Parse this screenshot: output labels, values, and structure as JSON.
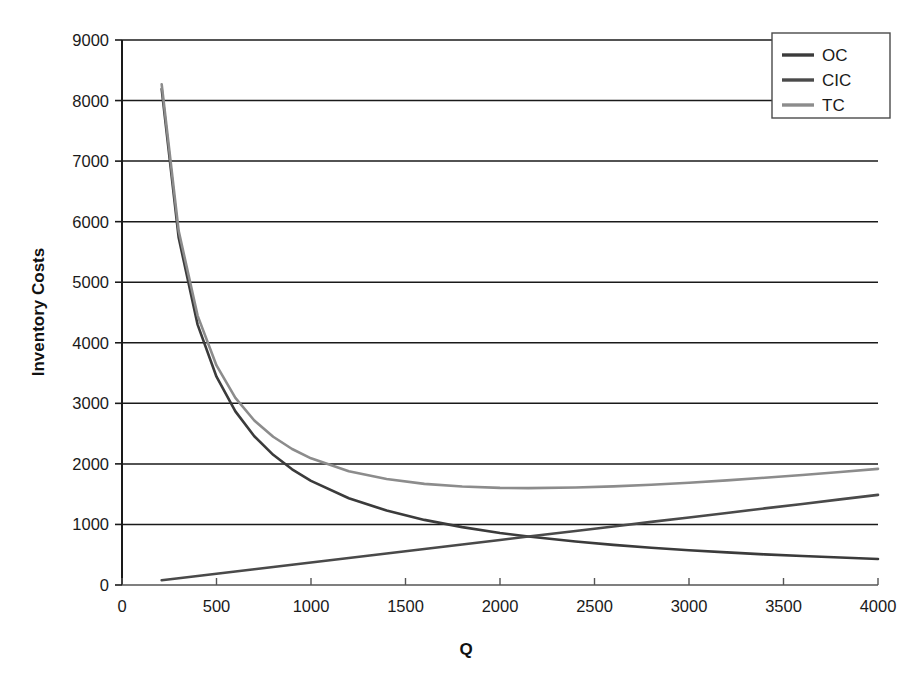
{
  "chart_data": {
    "type": "line",
    "title": "",
    "xlabel": "Q",
    "ylabel": "Inventory Costs",
    "xlim": [
      0,
      4000
    ],
    "ylim": [
      0,
      9000
    ],
    "xticks": [
      0,
      500,
      1000,
      1500,
      2000,
      2500,
      3000,
      3500,
      4000
    ],
    "yticks": [
      0,
      1000,
      2000,
      3000,
      4000,
      5000,
      6000,
      7000,
      8000,
      9000
    ],
    "xtick_labels": [
      "0",
      "500",
      "1000",
      "1500",
      "2000",
      "2500",
      "3000",
      "3500",
      "4000"
    ],
    "ytick_labels": [
      "0",
      "1000",
      "2000",
      "3000",
      "4000",
      "5000",
      "6000",
      "7000",
      "8000",
      "9000"
    ],
    "grid": "horizontal",
    "legend_position": "top-right",
    "legend_entries": [
      "OC",
      "CIC",
      "TC"
    ],
    "x": [
      210,
      300,
      400,
      500,
      600,
      700,
      800,
      900,
      1000,
      1200,
      1400,
      1600,
      1800,
      2000,
      2150,
      2400,
      2600,
      2800,
      3000,
      3200,
      3400,
      3600,
      3800,
      4000
    ],
    "series": [
      {
        "name": "OC",
        "label": "OC",
        "color": "#3b3b3b",
        "values": [
          8190,
          5733,
          4300,
          3440,
          2867,
          2457,
          2150,
          1911,
          1720,
          1433,
          1229,
          1075,
          956,
          860,
          800,
          717,
          662,
          614,
          573,
          538,
          506,
          478,
          453,
          430
        ]
      },
      {
        "name": "CIC",
        "label": "CIC",
        "color": "#4a4a4a",
        "values": [
          78,
          112,
          149,
          186,
          223,
          260,
          298,
          335,
          372,
          446,
          521,
          595,
          670,
          744,
          800,
          893,
          967,
          1042,
          1116,
          1190,
          1265,
          1339,
          1414,
          1488
        ]
      },
      {
        "name": "TC",
        "label": "TC",
        "color": "#8c8c8c",
        "values": [
          8268,
          5845,
          4449,
          3626,
          3090,
          2717,
          2448,
          2246,
          2092,
          1879,
          1750,
          1670,
          1626,
          1604,
          1600,
          1610,
          1629,
          1656,
          1689,
          1728,
          1771,
          1817,
          1867,
          1918
        ]
      }
    ],
    "notes": {
      "intersection_q": 2150,
      "intersection_value": 800,
      "tc_minimum_q": 2150,
      "tc_minimum_value": 1600
    }
  },
  "legend": {
    "items": [
      {
        "label": "OC",
        "color": "#3b3b3b"
      },
      {
        "label": "CIC",
        "color": "#4a4a4a"
      },
      {
        "label": "TC",
        "color": "#8c8c8c"
      }
    ]
  },
  "axes": {
    "y_title": "Inventory Costs",
    "x_title": "Q"
  }
}
